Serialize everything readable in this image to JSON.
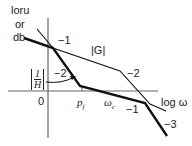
{
  "diagram": {
    "y_axis_label": [
      "loru",
      "or",
      "db"
    ],
    "x_axis_label": "log ω",
    "origin_label": "0",
    "x_ticks": [
      {
        "label": "p_f",
        "display": "p",
        "sub": "f"
      },
      {
        "label": "ω_c",
        "display": "ω",
        "sub": "c"
      }
    ],
    "curves": [
      {
        "name": "|G|",
        "label": "|G|",
        "style": "thin",
        "slopes": [
          "-1",
          "-2",
          "-1"
        ]
      },
      {
        "name": "|1/H|",
        "label_num": "1",
        "label_den": "H",
        "style": "thick",
        "slopes": [
          "-1",
          "-2",
          "-1",
          "-3"
        ]
      }
    ],
    "slope_labels": [
      "−1",
      "−2",
      "−2",
      "−1",
      "−3"
    ],
    "colors": {
      "line": "#111111",
      "axis": "#555555",
      "text": "#222222"
    }
  }
}
